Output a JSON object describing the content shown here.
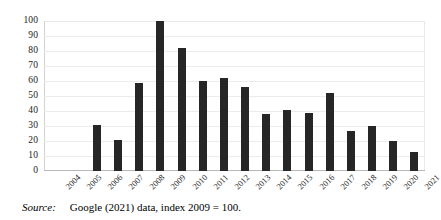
{
  "chart_data": {
    "type": "bar",
    "title": "",
    "xlabel": "",
    "ylabel": "",
    "ylim": [
      0,
      100
    ],
    "ytick_step": 10,
    "grid": true,
    "legend": false,
    "bar_color": "#262626",
    "categories": [
      "2004",
      "2005",
      "2006",
      "2007",
      "2008",
      "2009",
      "2010",
      "2011",
      "2012",
      "2013",
      "2014",
      "2015",
      "2016",
      "2017",
      "2018",
      "2019",
      "2020",
      "2021"
    ],
    "values": [
      0,
      0,
      31,
      21,
      59,
      100,
      82,
      60,
      62,
      56,
      38,
      41,
      39,
      52,
      27,
      30,
      20,
      13
    ],
    "ytick_labels": [
      "100",
      "90",
      "80",
      "70",
      "60",
      "50",
      "40",
      "30",
      "20",
      "10",
      "0"
    ],
    "ytick_values": [
      100,
      90,
      80,
      70,
      60,
      50,
      40,
      30,
      20,
      10,
      0
    ]
  },
  "caption": {
    "source_label": "Source:",
    "source_text": "Google (2021) data, index 2009 = 100."
  }
}
